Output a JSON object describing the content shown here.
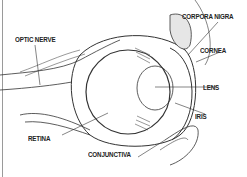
{
  "diagram": {
    "labels": {
      "optic_nerve": "OPTIC NERVE",
      "corpora_nigra": "CORPORA NIGRA",
      "cornea": "CORNEA",
      "lens": "LENS",
      "iris": "IRIS",
      "retina": "RETINA",
      "conjunctiva": "CONJUNCTIVA"
    },
    "colors": {
      "line": "#333333",
      "shade": "#bdbdbd",
      "frame": "#9a9a9a"
    }
  }
}
